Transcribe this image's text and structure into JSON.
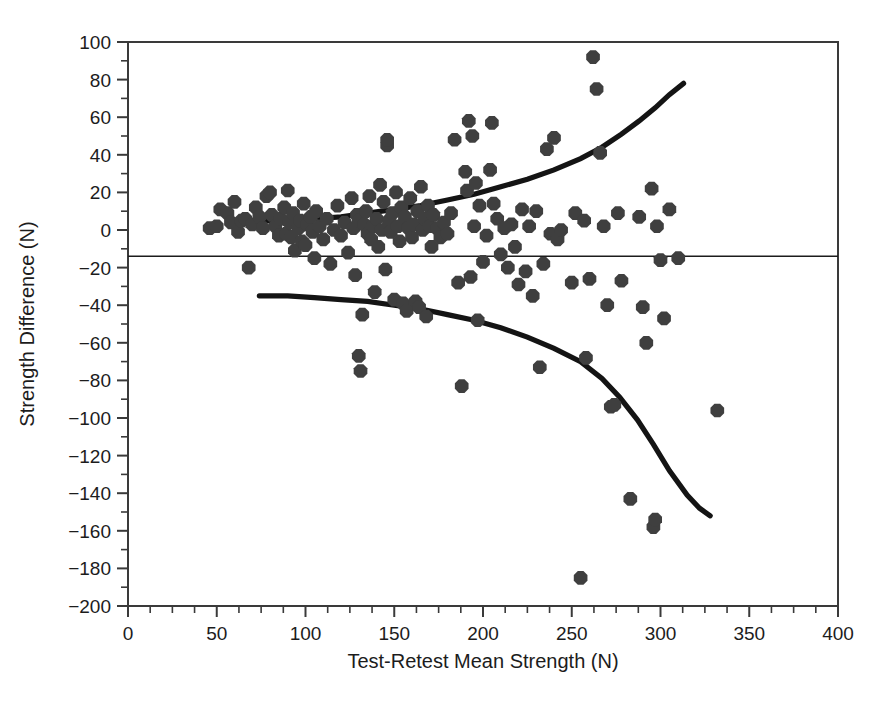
{
  "chart_data": {
    "type": "scatter",
    "title": "",
    "xlabel": "Test-Retest Mean Strength (N)",
    "ylabel": "Strength Difference (N)",
    "xlim": [
      0,
      400
    ],
    "ylim": [
      -200,
      100
    ],
    "xticks": [
      0,
      50,
      100,
      150,
      200,
      250,
      300,
      350,
      400
    ],
    "xtick_labels": [
      "0",
      "50",
      "100",
      "150",
      "200",
      "250",
      "300",
      "350",
      "400"
    ],
    "x_minor_step": 12.5,
    "yticks": [
      -200,
      -180,
      -160,
      -140,
      -120,
      -100,
      -80,
      -60,
      -40,
      -20,
      0,
      20,
      40,
      60,
      80,
      100
    ],
    "ytick_labels": [
      "−200",
      "−180",
      "−160",
      "−140",
      "−120",
      "−100",
      "−80",
      "−60",
      "−40",
      "−20",
      "0",
      "20",
      "40",
      "60",
      "80",
      "100"
    ],
    "y_minor_step": 10,
    "grid": false,
    "legend": null,
    "marker_color": "#3f3f3f",
    "line_color": "#141414",
    "axis_color": "#3a3a3a",
    "mean_difference": -14,
    "mean_line": {
      "label": "mean difference",
      "y": -14,
      "x_start": 0,
      "x_end": 400
    },
    "limits_of_agreement": {
      "note": "regression-based 95% limits of agreement, widening with mean strength",
      "upper_curve": [
        [
          76,
          5
        ],
        [
          90,
          5
        ],
        [
          105,
          6
        ],
        [
          120,
          7
        ],
        [
          135,
          9
        ],
        [
          150,
          11
        ],
        [
          165,
          13
        ],
        [
          180,
          16
        ],
        [
          195,
          19
        ],
        [
          210,
          23
        ],
        [
          225,
          27
        ],
        [
          240,
          32
        ],
        [
          255,
          38
        ],
        [
          267,
          44
        ],
        [
          278,
          51
        ],
        [
          288,
          58
        ],
        [
          297,
          65
        ],
        [
          305,
          72
        ],
        [
          313,
          78
        ]
      ],
      "lower_curve": [
        [
          74,
          -35
        ],
        [
          90,
          -35
        ],
        [
          105,
          -36
        ],
        [
          120,
          -37
        ],
        [
          135,
          -38
        ],
        [
          150,
          -40
        ],
        [
          165,
          -42
        ],
        [
          180,
          -45
        ],
        [
          195,
          -48
        ],
        [
          210,
          -52
        ],
        [
          225,
          -57
        ],
        [
          240,
          -63
        ],
        [
          255,
          -70
        ],
        [
          267,
          -79
        ],
        [
          277,
          -89
        ],
        [
          287,
          -101
        ],
        [
          296,
          -114
        ],
        [
          305,
          -128
        ],
        [
          315,
          -141
        ],
        [
          322,
          -148
        ],
        [
          328,
          -152
        ]
      ]
    },
    "points": [
      [
        46,
        1
      ],
      [
        50,
        2
      ],
      [
        52,
        11
      ],
      [
        56,
        9
      ],
      [
        58,
        4
      ],
      [
        60,
        15
      ],
      [
        62,
        -1
      ],
      [
        64,
        5
      ],
      [
        66,
        6
      ],
      [
        68,
        -20
      ],
      [
        70,
        3
      ],
      [
        72,
        12
      ],
      [
        74,
        7
      ],
      [
        76,
        1
      ],
      [
        78,
        18
      ],
      [
        80,
        20
      ],
      [
        81,
        8
      ],
      [
        83,
        2
      ],
      [
        85,
        -3
      ],
      [
        86,
        6
      ],
      [
        88,
        12
      ],
      [
        89,
        -2
      ],
      [
        90,
        21
      ],
      [
        91,
        4
      ],
      [
        92,
        -4
      ],
      [
        93,
        9
      ],
      [
        94,
        -11
      ],
      [
        96,
        1
      ],
      [
        97,
        5
      ],
      [
        98,
        -6
      ],
      [
        99,
        14
      ],
      [
        100,
        -8
      ],
      [
        101,
        3
      ],
      [
        103,
        7
      ],
      [
        104,
        -1
      ],
      [
        105,
        -15
      ],
      [
        106,
        10
      ],
      [
        108,
        2
      ],
      [
        110,
        -5
      ],
      [
        112,
        6
      ],
      [
        114,
        -18
      ],
      [
        116,
        0
      ],
      [
        118,
        13
      ],
      [
        120,
        -3
      ],
      [
        122,
        4
      ],
      [
        124,
        -12
      ],
      [
        126,
        17
      ],
      [
        127,
        1
      ],
      [
        128,
        -24
      ],
      [
        129,
        8
      ],
      [
        130,
        -67
      ],
      [
        130,
        5
      ],
      [
        131,
        -75
      ],
      [
        132,
        -45
      ],
      [
        133,
        3
      ],
      [
        134,
        10
      ],
      [
        135,
        -2
      ],
      [
        136,
        18
      ],
      [
        137,
        -5
      ],
      [
        138,
        2
      ],
      [
        139,
        -33
      ],
      [
        140,
        6
      ],
      [
        141,
        -9
      ],
      [
        142,
        24
      ],
      [
        143,
        0
      ],
      [
        144,
        15
      ],
      [
        145,
        -21
      ],
      [
        146,
        45
      ],
      [
        146,
        48
      ],
      [
        147,
        5
      ],
      [
        148,
        -1
      ],
      [
        149,
        9
      ],
      [
        150,
        -37
      ],
      [
        151,
        20
      ],
      [
        152,
        2
      ],
      [
        153,
        -6
      ],
      [
        154,
        12
      ],
      [
        155,
        -39
      ],
      [
        156,
        7
      ],
      [
        157,
        -43
      ],
      [
        158,
        1
      ],
      [
        159,
        17
      ],
      [
        160,
        -4
      ],
      [
        161,
        3
      ],
      [
        162,
        -38
      ],
      [
        163,
        10
      ],
      [
        164,
        -41
      ],
      [
        165,
        23
      ],
      [
        166,
        0
      ],
      [
        167,
        6
      ],
      [
        168,
        -46
      ],
      [
        169,
        13
      ],
      [
        170,
        2
      ],
      [
        171,
        -9
      ],
      [
        172,
        8
      ],
      [
        174,
        1
      ],
      [
        176,
        -4
      ],
      [
        178,
        4
      ],
      [
        180,
        -2
      ],
      [
        182,
        9
      ],
      [
        184,
        48
      ],
      [
        186,
        -28
      ],
      [
        188,
        -83
      ],
      [
        190,
        31
      ],
      [
        191,
        21
      ],
      [
        192,
        58
      ],
      [
        193,
        -25
      ],
      [
        194,
        50
      ],
      [
        195,
        2
      ],
      [
        196,
        25
      ],
      [
        197,
        -48
      ],
      [
        198,
        13
      ],
      [
        200,
        -17
      ],
      [
        202,
        -3
      ],
      [
        204,
        32
      ],
      [
        205,
        57
      ],
      [
        206,
        14
      ],
      [
        208,
        6
      ],
      [
        210,
        -13
      ],
      [
        212,
        1
      ],
      [
        214,
        -20
      ],
      [
        216,
        3
      ],
      [
        218,
        -9
      ],
      [
        220,
        -29
      ],
      [
        222,
        11
      ],
      [
        224,
        -22
      ],
      [
        226,
        2
      ],
      [
        228,
        -35
      ],
      [
        230,
        10
      ],
      [
        232,
        -73
      ],
      [
        234,
        -18
      ],
      [
        236,
        43
      ],
      [
        238,
        -2
      ],
      [
        240,
        49
      ],
      [
        242,
        -5
      ],
      [
        244,
        0
      ],
      [
        250,
        -28
      ],
      [
        252,
        9
      ],
      [
        255,
        -185
      ],
      [
        257,
        5
      ],
      [
        258,
        -68
      ],
      [
        260,
        -26
      ],
      [
        262,
        92
      ],
      [
        264,
        75
      ],
      [
        266,
        41
      ],
      [
        268,
        2
      ],
      [
        270,
        -40
      ],
      [
        272,
        -94
      ],
      [
        274,
        -93
      ],
      [
        276,
        9
      ],
      [
        278,
        -27
      ],
      [
        283,
        -143
      ],
      [
        288,
        7
      ],
      [
        290,
        -41
      ],
      [
        292,
        -60
      ],
      [
        295,
        22
      ],
      [
        296,
        -158
      ],
      [
        297,
        -154
      ],
      [
        298,
        2
      ],
      [
        300,
        -16
      ],
      [
        302,
        -47
      ],
      [
        305,
        11
      ],
      [
        310,
        -15
      ],
      [
        332,
        -96
      ]
    ]
  }
}
